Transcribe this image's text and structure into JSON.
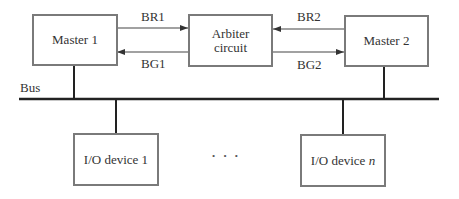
{
  "diagram": {
    "title": "",
    "nodes": {
      "master1": {
        "label": "Master 1"
      },
      "arbiter": {
        "line1": "Arbiter",
        "line2": "circuit"
      },
      "master2": {
        "label": "Master 2"
      },
      "io1": {
        "label": "I/O device 1"
      },
      "ion": {
        "prefix": "I/O device ",
        "var": "n"
      }
    },
    "signals": {
      "br1": "BR1",
      "bg1": "BG1",
      "br2": "BR2",
      "bg2": "BG2"
    },
    "bus_label": "Bus",
    "ellipsis": "• • •",
    "edges": [
      {
        "from": "master1",
        "to": "arbiter",
        "label": "BR1"
      },
      {
        "from": "arbiter",
        "to": "master1",
        "label": "BG1"
      },
      {
        "from": "master2",
        "to": "arbiter",
        "label": "BR2"
      },
      {
        "from": "arbiter",
        "to": "master2",
        "label": "BG2"
      },
      {
        "from": "master1",
        "to": "bus"
      },
      {
        "from": "master2",
        "to": "bus"
      },
      {
        "from": "bus",
        "to": "io1"
      },
      {
        "from": "bus",
        "to": "ion"
      }
    ],
    "colors": {
      "line": "#333333",
      "box_border": "#7a7a7a"
    }
  }
}
